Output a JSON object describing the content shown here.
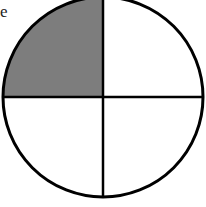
{
  "figure": {
    "type": "fraction-circle",
    "parts": 4,
    "shaded_parts": 1,
    "shaded_quadrant": "top-left",
    "colors": {
      "shade": "#7d7d7d",
      "stroke": "#000000",
      "background": "#ffffff"
    },
    "clipped_label": "e"
  }
}
